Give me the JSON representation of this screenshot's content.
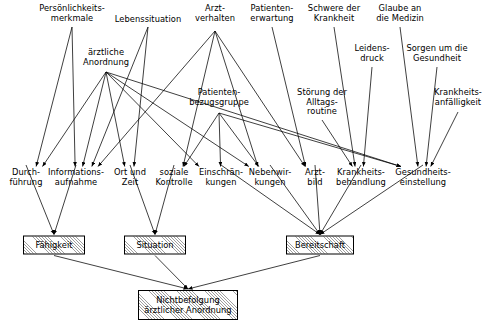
{
  "diagram": {
    "language": "de",
    "stroke_color": "#000000",
    "background_color": "#ffffff",
    "box_fill_color": "#d9d9d9",
    "nodes": [
      {
        "id": "persoenlichkeitsmerkmale",
        "label": "Persönlichkeits-\nmerkmale",
        "x": 72,
        "y": 4,
        "anchor_x": 72,
        "anchor_y": 27,
        "type": "plain",
        "row": "top"
      },
      {
        "id": "lebenssituation",
        "label": "Lebenssituation",
        "x": 148,
        "y": 15,
        "anchor_x": 148,
        "anchor_y": 27,
        "type": "plain",
        "row": "top"
      },
      {
        "id": "arztverhalten",
        "label": "Arzt-\nverhalten",
        "x": 215,
        "y": 4,
        "anchor_x": 215,
        "anchor_y": 31,
        "type": "plain",
        "row": "top"
      },
      {
        "id": "patientenerwartung",
        "label": "Patienten-\nerwartung",
        "x": 272,
        "y": 4,
        "anchor_x": 272,
        "anchor_y": 27,
        "type": "plain",
        "row": "top"
      },
      {
        "id": "schwere_der_krankheit",
        "label": "Schwere der\nKrankheit",
        "x": 334,
        "y": 4,
        "anchor_x": 334,
        "anchor_y": 27,
        "type": "plain",
        "row": "top"
      },
      {
        "id": "glaube_an_die_medizin",
        "label": "Glaube an\ndie Medizin",
        "x": 400,
        "y": 4,
        "anchor_x": 400,
        "anchor_y": 27,
        "type": "plain",
        "row": "top"
      },
      {
        "id": "aerztliche_anordnung",
        "label": "ärztliche\nAnordnung",
        "x": 106,
        "y": 48,
        "anchor_x": 106,
        "anchor_y": 72,
        "type": "plain",
        "row": "upper"
      },
      {
        "id": "leidensdruck",
        "label": "Leidens-\ndruck",
        "x": 372,
        "y": 44,
        "anchor_x": 372,
        "anchor_y": 67,
        "type": "plain",
        "row": "upper"
      },
      {
        "id": "sorgen_um_die_gesundheit",
        "label": "Sorgen um die\nGesundheit",
        "x": 437,
        "y": 44,
        "anchor_x": 437,
        "anchor_y": 67,
        "type": "plain",
        "row": "upper"
      },
      {
        "id": "patientenbezugsgruppe",
        "label": "Patienten-\nbezugsgruppe",
        "x": 219,
        "y": 88,
        "anchor_x": 219,
        "anchor_y": 113,
        "type": "plain",
        "row": "mid"
      },
      {
        "id": "stoerung_alltagsroutine",
        "label": "Störung der\nAlltags-\nroutine",
        "x": 322,
        "y": 88,
        "anchor_x": 322,
        "anchor_y": 120,
        "type": "plain",
        "row": "mid"
      },
      {
        "id": "krankheitsanfaelligkeit",
        "label": "Krankheits-\nanfälligkeit",
        "x": 458,
        "y": 88,
        "anchor_x": 458,
        "anchor_y": 112,
        "type": "plain",
        "row": "mid"
      },
      {
        "id": "durchfuehrung",
        "label": "Durch-\nführung",
        "x": 26,
        "y": 168,
        "anchor_x": 26,
        "anchor_y": 165,
        "type": "plain",
        "row": "lower"
      },
      {
        "id": "informationsaufnahme",
        "label": "Informations-\naufnahme",
        "x": 76,
        "y": 168,
        "anchor_x": 76,
        "anchor_y": 165,
        "type": "plain",
        "row": "lower"
      },
      {
        "id": "ort_und_zeit",
        "label": "Ort und\nZeit",
        "x": 130,
        "y": 168,
        "anchor_x": 130,
        "anchor_y": 165,
        "type": "plain",
        "row": "lower"
      },
      {
        "id": "soziale_kontrolle",
        "label": "soziale\nKontrolle",
        "x": 174,
        "y": 168,
        "anchor_x": 174,
        "anchor_y": 165,
        "type": "plain",
        "row": "lower"
      },
      {
        "id": "einschraenkungen",
        "label": "Einschrän-\nkungen",
        "x": 221,
        "y": 168,
        "anchor_x": 221,
        "anchor_y": 165,
        "type": "plain",
        "row": "lower"
      },
      {
        "id": "nebenwirkungen",
        "label": "Nebenwir-\nkungen",
        "x": 270,
        "y": 168,
        "anchor_x": 270,
        "anchor_y": 165,
        "type": "plain",
        "row": "lower"
      },
      {
        "id": "arztbild",
        "label": "Arzt-\nbild",
        "x": 315,
        "y": 168,
        "anchor_x": 315,
        "anchor_y": 165,
        "type": "plain",
        "row": "lower"
      },
      {
        "id": "krankheitsbehandlung",
        "label": "Krankheits-\nbehandlung",
        "x": 361,
        "y": 168,
        "anchor_x": 361,
        "anchor_y": 165,
        "type": "plain",
        "row": "lower"
      },
      {
        "id": "gesundheitseinstellung",
        "label": "Gesundheits-\neinstellung",
        "x": 423,
        "y": 168,
        "anchor_x": 423,
        "anchor_y": 165,
        "type": "plain",
        "row": "lower"
      },
      {
        "id": "faehigkeit",
        "label": "Fähigkeit",
        "x": 54,
        "y": 245,
        "w": 62,
        "h": 19,
        "type": "box",
        "row": "factor"
      },
      {
        "id": "situation",
        "label": "Situation",
        "x": 155,
        "y": 245,
        "w": 62,
        "h": 19,
        "type": "box",
        "row": "factor"
      },
      {
        "id": "bereitschaft",
        "label": "Bereitschaft",
        "x": 320,
        "y": 245,
        "w": 68,
        "h": 19,
        "type": "box",
        "row": "factor"
      },
      {
        "id": "nichtbefolgung",
        "label": "Nichtbefolgung\närztlicher Anordnung",
        "x": 188,
        "y": 305,
        "w": 100,
        "h": 30,
        "type": "box",
        "row": "outcome"
      }
    ],
    "edges": [
      {
        "from": "persoenlichkeitsmerkmale",
        "to": "durchfuehrung"
      },
      {
        "from": "persoenlichkeitsmerkmale",
        "to": "informationsaufnahme"
      },
      {
        "from": "aerztliche_anordnung",
        "to": "durchfuehrung"
      },
      {
        "from": "aerztliche_anordnung",
        "to": "informationsaufnahme"
      },
      {
        "from": "aerztliche_anordnung",
        "to": "ort_und_zeit"
      },
      {
        "from": "aerztliche_anordnung",
        "to": "einschraenkungen"
      },
      {
        "from": "aerztliche_anordnung",
        "to": "nebenwirkungen"
      },
      {
        "from": "aerztliche_anordnung",
        "to": "gesundheitseinstellung"
      },
      {
        "from": "lebenssituation",
        "to": "informationsaufnahme"
      },
      {
        "from": "lebenssituation",
        "to": "ort_und_zeit"
      },
      {
        "from": "arztverhalten",
        "to": "informationsaufnahme"
      },
      {
        "from": "arztverhalten",
        "to": "soziale_kontrolle"
      },
      {
        "from": "arztverhalten",
        "to": "nebenwirkungen"
      },
      {
        "from": "arztverhalten",
        "to": "arztbild"
      },
      {
        "from": "patientenerwartung",
        "to": "arztbild"
      },
      {
        "from": "patientenbezugsgruppe",
        "to": "soziale_kontrolle"
      },
      {
        "from": "patientenbezugsgruppe",
        "to": "einschraenkungen"
      },
      {
        "from": "patientenbezugsgruppe",
        "to": "nebenwirkungen"
      },
      {
        "from": "patientenbezugsgruppe",
        "to": "gesundheitseinstellung"
      },
      {
        "from": "schwere_der_krankheit",
        "to": "krankheitsbehandlung"
      },
      {
        "from": "stoerung_alltagsroutine",
        "to": "krankheitsbehandlung"
      },
      {
        "from": "leidensdruck",
        "to": "krankheitsbehandlung"
      },
      {
        "from": "glaube_an_die_medizin",
        "to": "gesundheitseinstellung"
      },
      {
        "from": "sorgen_um_die_gesundheit",
        "to": "gesundheitseinstellung"
      },
      {
        "from": "krankheitsanfaelligkeit",
        "to": "gesundheitseinstellung"
      },
      {
        "from": "durchfuehrung",
        "to": "faehigkeit"
      },
      {
        "from": "informationsaufnahme",
        "to": "faehigkeit"
      },
      {
        "from": "ort_und_zeit",
        "to": "situation"
      },
      {
        "from": "soziale_kontrolle",
        "to": "situation"
      },
      {
        "from": "einschraenkungen",
        "to": "bereitschaft"
      },
      {
        "from": "nebenwirkungen",
        "to": "bereitschaft"
      },
      {
        "from": "arztbild",
        "to": "bereitschaft"
      },
      {
        "from": "krankheitsbehandlung",
        "to": "bereitschaft"
      },
      {
        "from": "gesundheitseinstellung",
        "to": "bereitschaft"
      },
      {
        "from": "faehigkeit",
        "to": "nichtbefolgung"
      },
      {
        "from": "situation",
        "to": "nichtbefolgung"
      },
      {
        "from": "bereitschaft",
        "to": "nichtbefolgung"
      }
    ]
  }
}
